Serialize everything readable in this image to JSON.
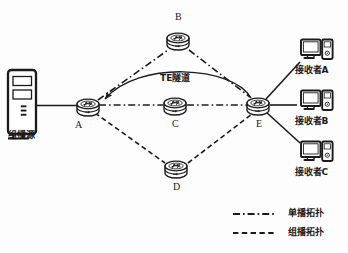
{
  "figure": {
    "type": "network-topology-diagram",
    "background": "#fdfdfd",
    "line_color": "#1b1b1b"
  },
  "source": {
    "label": "组播源",
    "icon": "tower-pc-icon"
  },
  "routers": [
    {
      "id": "A",
      "label": "A",
      "x": 88,
      "y": 106,
      "icon": "router-icon"
    },
    {
      "id": "B",
      "label": "B",
      "x": 178,
      "y": 40,
      "icon": "router-icon"
    },
    {
      "id": "C",
      "label": "C",
      "x": 175,
      "y": 105,
      "icon": "router-icon"
    },
    {
      "id": "D",
      "label": "D",
      "x": 176,
      "y": 168,
      "icon": "router-icon"
    },
    {
      "id": "E",
      "label": "E",
      "x": 258,
      "y": 105,
      "icon": "router-icon"
    }
  ],
  "receivers": [
    {
      "label": "接收者A",
      "icon": "desktop-pc-icon",
      "x": 312,
      "y": 48
    },
    {
      "label": "接收者B",
      "icon": "desktop-pc-icon",
      "x": 312,
      "y": 100
    },
    {
      "label": "接收者C",
      "icon": "desktop-pc-icon",
      "x": 312,
      "y": 152
    }
  ],
  "annotations": {
    "te_tunnel": "TE隧道"
  },
  "legend": {
    "items": [
      {
        "label": "单播拓扑",
        "style": "dash-dot",
        "swatch": "unicast-line-swatch"
      },
      {
        "label": "组播拓扑",
        "style": "dashed",
        "swatch": "multicast-line-swatch"
      }
    ]
  },
  "edges": [
    {
      "from": "source",
      "to": "A",
      "style": "solid"
    },
    {
      "from": "A",
      "to": "B",
      "style": "dash-dot"
    },
    {
      "from": "B",
      "to": "E",
      "style": "dash-dot"
    },
    {
      "from": "A",
      "to": "C",
      "style": "dash-dot"
    },
    {
      "from": "C",
      "to": "E",
      "style": "dash-dot"
    },
    {
      "from": "A",
      "to": "D",
      "style": "dashed"
    },
    {
      "from": "D",
      "to": "E",
      "style": "dashed"
    },
    {
      "from": "E",
      "to": "A",
      "style": "solid-arc-arrow",
      "note": "TE隧道"
    },
    {
      "from": "E",
      "to": "receiverA",
      "style": "solid"
    },
    {
      "from": "E",
      "to": "receiverB",
      "style": "solid"
    },
    {
      "from": "E",
      "to": "receiverC",
      "style": "solid"
    }
  ]
}
